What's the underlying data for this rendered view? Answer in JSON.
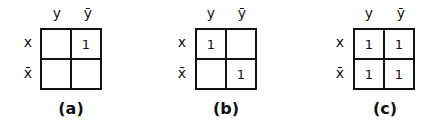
{
  "figure": {
    "col_labels": [
      "y",
      "ȳ"
    ],
    "row_labels": [
      "x",
      "x̄"
    ],
    "maps": [
      {
        "caption": "(a)",
        "cells": [
          [
            "",
            "1"
          ],
          [
            "",
            ""
          ]
        ]
      },
      {
        "caption": "(b)",
        "cells": [
          [
            "1",
            ""
          ],
          [
            "",
            "1"
          ]
        ]
      },
      {
        "caption": "(c)",
        "cells": [
          [
            "1",
            "1"
          ],
          [
            "1",
            "1"
          ]
        ]
      }
    ]
  }
}
